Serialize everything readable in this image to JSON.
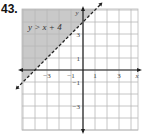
{
  "problem_number": "43.",
  "chart_data": {
    "type": "inequality-graph",
    "title": "",
    "inequality_label": "y > x + 4",
    "boundary": {
      "slope": 1,
      "intercept": 4,
      "style": "dashed"
    },
    "shaded_region": "above",
    "xlim": [
      -5,
      5
    ],
    "ylim": [
      -5,
      5
    ],
    "grid": true,
    "xlabel": "x",
    "ylabel": "y",
    "x_ticks": [
      -3,
      -1,
      1,
      3
    ],
    "y_ticks": [
      3,
      1,
      -1,
      -3
    ],
    "x_tick_labels": [
      "−3",
      "−1",
      "1",
      "3"
    ],
    "y_tick_labels": [
      "3",
      "1",
      "−1",
      "−3"
    ],
    "colors": {
      "shade": "#c9c9c9",
      "grid": "#b8b8b8",
      "axis": "#222222",
      "boundary": "#222222"
    }
  }
}
